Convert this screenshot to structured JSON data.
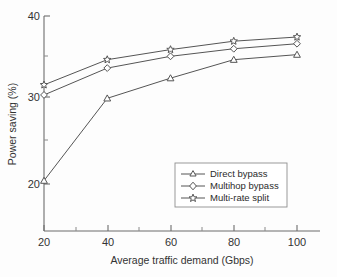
{
  "chart_data": {
    "type": "line",
    "title": "",
    "xlabel": "Average traffic demand (Gbps)",
    "ylabel": "Power saving (%)",
    "x": [
      20,
      40,
      60,
      80,
      100
    ],
    "xlim": [
      15,
      108
    ],
    "ylim": [
      14.5,
      40.8
    ],
    "xticks": [
      20,
      40,
      60,
      80,
      100
    ],
    "yticks": [
      20,
      30,
      40
    ],
    "yminorticks": [
      25,
      35
    ],
    "grid": false,
    "legend_position": "lower right",
    "series": [
      {
        "name": "Direct bypass",
        "marker": "triangle",
        "values": [
          20.4,
          30.2,
          32.6,
          34.8,
          35.4
        ]
      },
      {
        "name": "Multihop bypass",
        "marker": "diamond",
        "values": [
          30.6,
          33.8,
          35.2,
          36.1,
          36.7
        ]
      },
      {
        "name": "Multi-rate split",
        "marker": "star",
        "values": [
          31.8,
          34.8,
          36.0,
          37.0,
          37.5
        ]
      }
    ],
    "colors": {
      "line": "#555555",
      "marker_fill": "#ffffff",
      "axis": "#6d6d6d"
    }
  },
  "axis": {
    "x_tick_labels": [
      "20",
      "40",
      "60",
      "80",
      "100"
    ],
    "y_tick_labels": [
      "20",
      "30",
      "40"
    ],
    "x_title": "Average traffic demand (Gbps)",
    "y_title": "Power saving (%)"
  },
  "legend": {
    "items": [
      {
        "label": "Direct bypass"
      },
      {
        "label": "Multihop bypass"
      },
      {
        "label": "Multi-rate split"
      }
    ]
  }
}
